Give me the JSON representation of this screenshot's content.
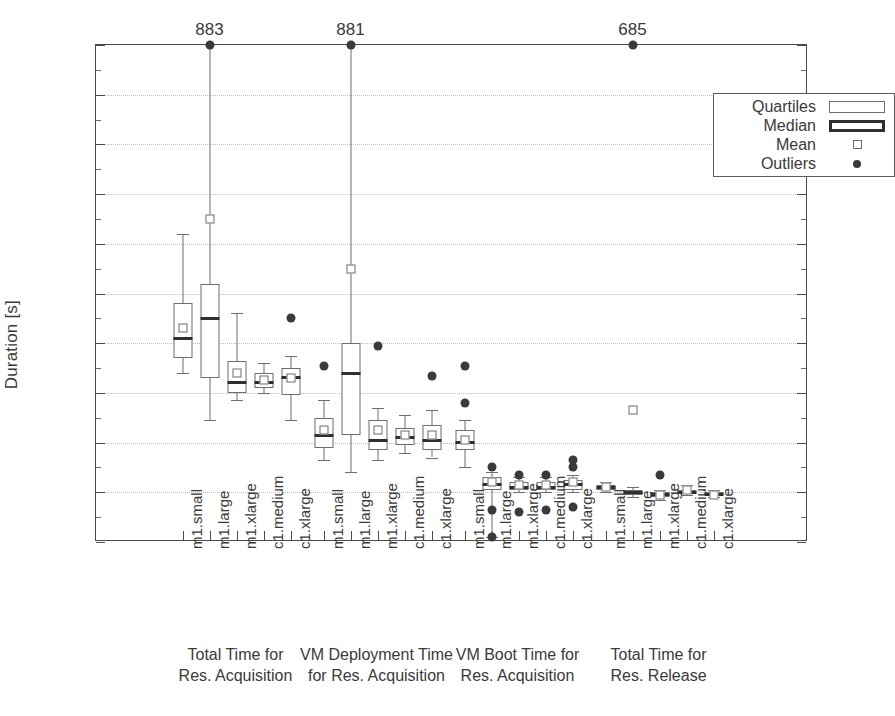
{
  "chart_data": {
    "type": "box",
    "title": "",
    "xlabel": "",
    "ylabel": "Duration [s]",
    "ylim": [
      0,
      200
    ],
    "ytick_step": 20,
    "yticks": [
      0,
      20,
      40,
      60,
      80,
      100,
      120,
      140,
      160,
      180,
      200
    ],
    "ytick_labels": [
      "0",
      "20",
      "40",
      "60",
      "80",
      "100",
      "120",
      "140",
      "160",
      "180",
      "200"
    ],
    "minor_tick_step": 10,
    "grid": "horizontal-dotted",
    "legend_position": "upper-right",
    "legend": [
      {
        "label": "Quartiles",
        "marker": "thin-outlined-rectangle"
      },
      {
        "label": "Median",
        "marker": "thick-outlined-rectangle"
      },
      {
        "label": "Mean",
        "marker": "small-open-square"
      },
      {
        "label": "Outliers",
        "marker": "filled-circle"
      }
    ],
    "categories": [
      "m1.small",
      "m1.large",
      "m1.xlarge",
      "c1.medium",
      "c1.xlarge"
    ],
    "groups": [
      {
        "name": "Total Time for\nRes. Acquisition",
        "line1": "Total Time for",
        "line2": "Res. Acquisition",
        "boxes": [
          {
            "category": "m1.small",
            "whisker_low": 68,
            "q1": 74,
            "median": 82,
            "q3": 96,
            "whisker_high": 124,
            "mean": 86,
            "outliers": [],
            "clipped_outlier_label": null
          },
          {
            "category": "m1.large",
            "whisker_low": 49,
            "q1": 66,
            "median": 90,
            "q3": 104,
            "whisker_high": 200,
            "mean": 130,
            "outliers": [
              200
            ],
            "clipped_outlier_label": "883"
          },
          {
            "category": "m1.xlarge",
            "whisker_low": 57,
            "q1": 60,
            "median": 64,
            "q3": 73,
            "whisker_high": 92,
            "mean": 68,
            "outliers": [],
            "clipped_outlier_label": null
          },
          {
            "category": "c1.medium",
            "whisker_low": 60,
            "q1": 62,
            "median": 64,
            "q3": 68,
            "whisker_high": 72,
            "mean": 65,
            "outliers": [],
            "clipped_outlier_label": null
          },
          {
            "category": "c1.xlarge",
            "whisker_low": 49,
            "q1": 59,
            "median": 66,
            "q3": 70,
            "whisker_high": 75,
            "mean": 66,
            "outliers": [
              90
            ],
            "clipped_outlier_label": null
          }
        ]
      },
      {
        "name": "VM Deployment Time\nfor Res. Acquisition",
        "line1": "VM Deployment Time",
        "line2": "for Res. Acquisition",
        "boxes": [
          {
            "category": "m1.small",
            "whisker_low": 33,
            "q1": 38,
            "median": 43,
            "q3": 50,
            "whisker_high": 57,
            "mean": 45,
            "outliers": [
              71
            ],
            "clipped_outlier_label": null
          },
          {
            "category": "m1.large",
            "whisker_low": 28,
            "q1": 43,
            "median": 68,
            "q3": 80,
            "whisker_high": 200,
            "mean": 110,
            "outliers": [
              200
            ],
            "clipped_outlier_label": "881"
          },
          {
            "category": "m1.xlarge",
            "whisker_low": 33,
            "q1": 37,
            "median": 41,
            "q3": 49,
            "whisker_high": 54,
            "mean": 45,
            "outliers": [
              79
            ],
            "clipped_outlier_label": null
          },
          {
            "category": "c1.medium",
            "whisker_low": 36,
            "q1": 39,
            "median": 42,
            "q3": 46,
            "whisker_high": 51,
            "mean": 43,
            "outliers": [],
            "clipped_outlier_label": null
          },
          {
            "category": "c1.xlarge",
            "whisker_low": 34,
            "q1": 37,
            "median": 41,
            "q3": 47,
            "whisker_high": 53,
            "mean": 43,
            "outliers": [
              67
            ],
            "clipped_outlier_label": null
          }
        ]
      },
      {
        "name": "VM Boot Time for\nRes. Acquisition",
        "line1": "VM Boot Time for",
        "line2": "Res. Acquisition",
        "boxes": [
          {
            "category": "m1.small",
            "whisker_low": 30,
            "q1": 37,
            "median": 40,
            "q3": 45,
            "whisker_high": 49,
            "mean": 41,
            "outliers": [
              56,
              71
            ],
            "clipped_outlier_label": null
          },
          {
            "category": "m1.large",
            "whisker_low": 2,
            "q1": 21,
            "median": 23,
            "q3": 26,
            "whisker_high": 28,
            "mean": 24,
            "outliers": [
              13,
              30,
              2
            ],
            "clipped_outlier_label": null
          },
          {
            "category": "m1.xlarge",
            "whisker_low": 20,
            "q1": 21,
            "median": 22,
            "q3": 24,
            "whisker_high": 26,
            "mean": 23,
            "outliers": [
              12,
              27
            ],
            "clipped_outlier_label": null
          },
          {
            "category": "c1.medium",
            "whisker_low": 20,
            "q1": 21,
            "median": 22,
            "q3": 24,
            "whisker_high": 26,
            "mean": 23,
            "outliers": [
              13,
              27
            ],
            "clipped_outlier_label": null
          },
          {
            "category": "c1.xlarge",
            "whisker_low": 20,
            "q1": 21,
            "median": 23,
            "q3": 25,
            "whisker_high": 27,
            "mean": 24,
            "outliers": [
              14,
              30,
              33
            ],
            "clipped_outlier_label": null
          }
        ]
      },
      {
        "name": "Total Time for\nRes. Release",
        "line1": "Total Time for",
        "line2": "Res. Release",
        "boxes": [
          {
            "category": "m1.small",
            "whisker_low": 20,
            "q1": 21,
            "median": 22,
            "q3": 23,
            "whisker_high": 24,
            "mean": 22,
            "outliers": [],
            "clipped_outlier_label": null
          },
          {
            "category": "m1.large",
            "whisker_low": 18,
            "q1": 19,
            "median": 20,
            "q3": 21,
            "whisker_high": 22,
            "mean": 53,
            "outliers": [
              200
            ],
            "clipped_outlier_label": "685"
          },
          {
            "category": "m1.xlarge",
            "whisker_low": 17,
            "q1": 18,
            "median": 19,
            "q3": 20,
            "whisker_high": 21,
            "mean": 19,
            "outliers": [
              27
            ],
            "clipped_outlier_label": null
          },
          {
            "category": "c1.medium",
            "whisker_low": 19,
            "q1": 20,
            "median": 20,
            "q3": 21,
            "whisker_high": 23,
            "mean": 21,
            "outliers": [],
            "clipped_outlier_label": null
          },
          {
            "category": "c1.xlarge",
            "whisker_low": 18,
            "q1": 19,
            "median": 19,
            "q3": 20,
            "whisker_high": 21,
            "mean": 19,
            "outliers": [],
            "clipped_outlier_label": null
          }
        ]
      }
    ]
  },
  "colors": {
    "axis": "#4a4a4a",
    "grid": "#bdbdbd",
    "box_outline": "#6d6d6d",
    "median": "#2f2f2f",
    "outlier": "#3a3a3a",
    "text": "#3a3a3a",
    "background": "#ffffff"
  }
}
